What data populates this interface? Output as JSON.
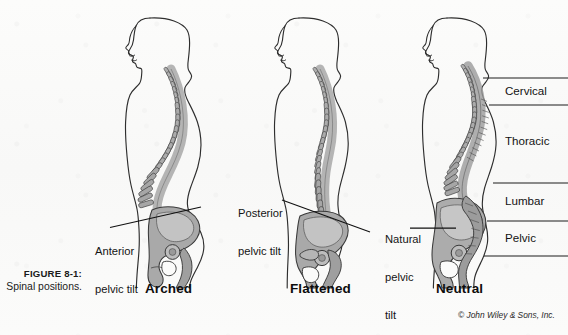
{
  "figure": {
    "number_label": "FIGURE 8-1:",
    "caption": "Spinal positions.",
    "copyright": "© John Wiley & Sons, Inc."
  },
  "panels": [
    {
      "id": "arched",
      "name": "Arched",
      "annotation": {
        "line1": "Anterior",
        "line2": "pelvic tilt"
      }
    },
    {
      "id": "flattened",
      "name": "Flattened",
      "annotation": {
        "line1": "Posterior",
        "line2": "pelvic tilt"
      }
    },
    {
      "id": "neutral",
      "name": "Neutral",
      "annotation": {
        "line1": "Natural",
        "line2": "pelvic",
        "line3": "tilt"
      }
    }
  ],
  "spine_regions": [
    {
      "id": "cervical",
      "label": "Cervical"
    },
    {
      "id": "thoracic",
      "label": "Thoracic"
    },
    {
      "id": "lumbar",
      "label": "Lumbar"
    },
    {
      "id": "pelvic",
      "label": "Pelvic"
    }
  ],
  "colors": {
    "background": "#fbfbfa",
    "outline": "#2a2a2a",
    "bone_fill": "#a8a8a8",
    "bone_light": "#c2c2c2",
    "bone_dark": "#6f6f6f",
    "text": "#131313",
    "rule": "#1e1e1e"
  }
}
